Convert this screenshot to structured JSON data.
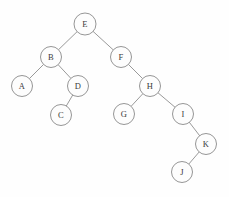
{
  "figure": {
    "width": 229,
    "height": 197,
    "background_color": "#fefefe",
    "node_fill_color": "#fdfdfd",
    "node_stroke_color": "#8a8a8a",
    "edge_color": "#8d8d8d",
    "label_color": "#3a3a3a"
  },
  "tree": {
    "root": "E",
    "nodes": [
      {
        "id": "E",
        "label": "E",
        "x": 85,
        "y": 24,
        "r": 11,
        "depth": 0
      },
      {
        "id": "B",
        "label": "B",
        "x": 51,
        "y": 57,
        "r": 10.5,
        "depth": 1
      },
      {
        "id": "F",
        "label": "F",
        "x": 121,
        "y": 57,
        "r": 10.5,
        "depth": 1
      },
      {
        "id": "A",
        "label": "A",
        "x": 22,
        "y": 86,
        "r": 10.5,
        "depth": 2
      },
      {
        "id": "D",
        "label": "D",
        "x": 78,
        "y": 86,
        "r": 10.5,
        "depth": 2
      },
      {
        "id": "H",
        "label": "H",
        "x": 150,
        "y": 86,
        "r": 10.5,
        "depth": 2
      },
      {
        "id": "C",
        "label": "C",
        "x": 61,
        "y": 115,
        "r": 10.5,
        "depth": 3
      },
      {
        "id": "G",
        "label": "G",
        "x": 124,
        "y": 114,
        "r": 10.5,
        "depth": 3
      },
      {
        "id": "I",
        "label": "I",
        "x": 183,
        "y": 114,
        "r": 10.5,
        "depth": 3
      },
      {
        "id": "K",
        "label": "K",
        "x": 206,
        "y": 144,
        "r": 10.5,
        "depth": 4
      },
      {
        "id": "J",
        "label": "J",
        "x": 182,
        "y": 172,
        "r": 10.5,
        "depth": 5
      }
    ],
    "edges": [
      {
        "from": "E",
        "to": "B",
        "side": "left"
      },
      {
        "from": "E",
        "to": "F",
        "side": "right"
      },
      {
        "from": "B",
        "to": "A",
        "side": "left"
      },
      {
        "from": "B",
        "to": "D",
        "side": "right"
      },
      {
        "from": "D",
        "to": "C",
        "side": "left"
      },
      {
        "from": "F",
        "to": "H",
        "side": "right"
      },
      {
        "from": "H",
        "to": "G",
        "side": "left"
      },
      {
        "from": "H",
        "to": "I",
        "side": "right"
      },
      {
        "from": "I",
        "to": "K",
        "side": "right"
      },
      {
        "from": "K",
        "to": "J",
        "side": "left"
      }
    ]
  }
}
